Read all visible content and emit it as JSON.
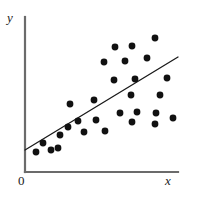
{
  "figure": {
    "name": "scatter-plot-with-regression-line",
    "width": 199,
    "height": 197,
    "background_color": "#ffffff"
  },
  "labels": {
    "y_axis": "y",
    "x_axis": "x",
    "origin": "0"
  },
  "style": {
    "axis_color": "#6b6b6b",
    "axis_width": 2.2,
    "point_color": "#111111",
    "point_radius": 3.4,
    "line_color": "#1a1a1a",
    "line_width": 1.3
  },
  "chart_data": {
    "type": "scatter",
    "title": "",
    "xlabel": "x",
    "ylabel": "y",
    "grid": false,
    "legend": null,
    "axes": {
      "x_origin_px": 25,
      "y_origin_px": 172,
      "x_end_px": 178,
      "y_top_px": 17,
      "x_tick_labels": [
        "0"
      ],
      "y_tick_labels": [],
      "arrowheads": false
    },
    "points_px": [
      [
        36,
        152
      ],
      [
        43,
        143
      ],
      [
        51,
        150
      ],
      [
        58,
        148
      ],
      [
        60,
        135
      ],
      [
        68,
        127
      ],
      [
        70,
        104
      ],
      [
        78,
        121
      ],
      [
        84,
        132
      ],
      [
        94,
        100
      ],
      [
        96,
        120
      ],
      [
        104,
        62
      ],
      [
        105,
        131
      ],
      [
        114,
        80
      ],
      [
        115,
        47
      ],
      [
        120,
        113
      ],
      [
        125,
        61
      ],
      [
        131,
        95
      ],
      [
        132,
        46
      ],
      [
        132,
        122
      ],
      [
        135,
        79
      ],
      [
        137,
        112
      ],
      [
        147,
        58
      ],
      [
        155,
        38
      ],
      [
        156,
        113
      ],
      [
        155,
        124
      ],
      [
        160,
        95
      ],
      [
        167,
        78
      ],
      [
        173,
        118
      ]
    ],
    "n_points": 29,
    "regression_line_px": {
      "x1": 25,
      "y1": 150,
      "x2": 178,
      "y2": 57
    },
    "relationship": "positive linear association"
  }
}
